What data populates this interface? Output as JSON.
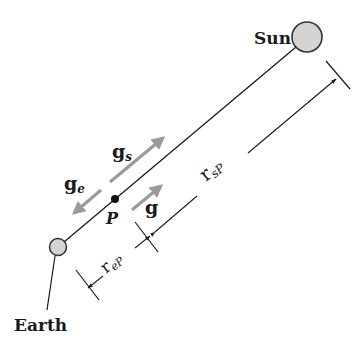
{
  "diagram": {
    "bodies": {
      "sun": {
        "label": "Sun",
        "fill": "#d4d4d4",
        "stroke": "#333333"
      },
      "earth": {
        "label": "Earth",
        "fill": "#d4d4d4",
        "stroke": "#333333"
      }
    },
    "point": {
      "label": "P"
    },
    "vectors": {
      "g_s": {
        "main": "g",
        "sub": "s"
      },
      "g_e": {
        "main": "g",
        "sub": "e"
      },
      "g": {
        "main": "g"
      }
    },
    "dimensions": {
      "r_sP": {
        "main": "r",
        "sub": "sP"
      },
      "r_eP": {
        "main": "r",
        "sub": "eP"
      }
    },
    "colors": {
      "line": "#1a1a1a",
      "arrow_gray": "#9a9a9a",
      "body_fill": "#d4d4d4"
    }
  }
}
